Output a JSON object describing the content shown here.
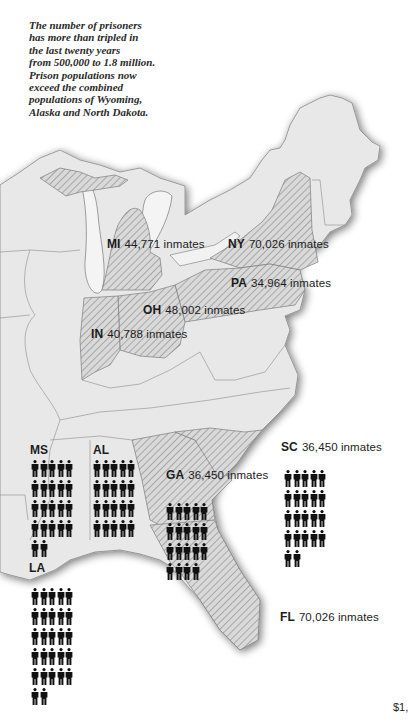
{
  "intro": {
    "lines": [
      "The number of prisoners",
      "has more than tripled in",
      "the last twenty years",
      "from 500,000 to 1.8 million.",
      "Prison populations now",
      "exceed the combined",
      "populations of Wyoming,",
      "Alaska and North Dakota."
    ]
  },
  "colors": {
    "land": "#e9e9e9",
    "hatched_state_fill": "#d6d6d6",
    "hatch_stroke": "#9a9a9a",
    "border": "#8a8a8a",
    "text": "#1c1c1c"
  },
  "states": [
    {
      "abbr": "MI",
      "value": "44,771 inmates",
      "hatched": true
    },
    {
      "abbr": "NY",
      "value": "70,026 inmates",
      "hatched": true
    },
    {
      "abbr": "PA",
      "value": "34,964 inmates",
      "hatched": true
    },
    {
      "abbr": "OH",
      "value": "48,002 inmates",
      "hatched": true
    },
    {
      "abbr": "IN",
      "value": "40,788 inmates",
      "hatched": true
    },
    {
      "abbr": "SC",
      "value": "36,450 inmates",
      "hatched": false
    },
    {
      "abbr": "GA",
      "value": "36,450 inmates",
      "hatched": true
    },
    {
      "abbr": "FL",
      "value": "70,026 inmates",
      "hatched": true
    },
    {
      "abbr": "MS",
      "value": "",
      "hatched": false
    },
    {
      "abbr": "AL",
      "value": "",
      "hatched": false
    },
    {
      "abbr": "LA",
      "value": "",
      "hatched": false
    }
  ],
  "pictograms": [
    {
      "state": "MS",
      "count": 22
    },
    {
      "state": "AL",
      "count": 20
    },
    {
      "state": "LA",
      "count": 27
    },
    {
      "state": "GA",
      "count": 19
    },
    {
      "state": "SC",
      "count": 22
    }
  ],
  "footer": {
    "text": "$1,"
  }
}
